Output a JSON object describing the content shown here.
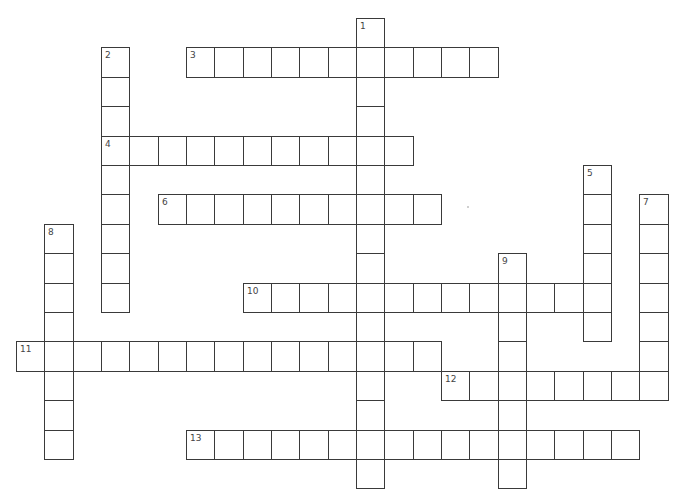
{
  "puzzle": {
    "grid": {
      "origin_x": 16,
      "origin_y": 18,
      "col_pitch": 28.33,
      "row_pitch": 29.4,
      "line_color": "#3a3a3a",
      "cell_fill": "#ffffff"
    },
    "words": [
      {
        "number": "1",
        "direction": "down",
        "row": 0,
        "col": 12,
        "length": 16
      },
      {
        "number": "2",
        "direction": "down",
        "row": 1,
        "col": 3,
        "length": 9
      },
      {
        "number": "3",
        "direction": "across",
        "row": 1,
        "col": 6,
        "length": 11
      },
      {
        "number": "4",
        "direction": "across",
        "row": 4,
        "col": 3,
        "length": 11
      },
      {
        "number": "5",
        "direction": "down",
        "row": 5,
        "col": 20,
        "length": 6
      },
      {
        "number": "6",
        "direction": "across",
        "row": 6,
        "col": 5,
        "length": 10
      },
      {
        "number": "7",
        "direction": "down",
        "row": 6,
        "col": 22,
        "length": 7
      },
      {
        "number": "8",
        "direction": "down",
        "row": 7,
        "col": 1,
        "length": 8
      },
      {
        "number": "9",
        "direction": "down",
        "row": 8,
        "col": 17,
        "length": 8
      },
      {
        "number": "10",
        "direction": "across",
        "row": 9,
        "col": 8,
        "length": 13
      },
      {
        "number": "11",
        "direction": "across",
        "row": 11,
        "col": 0,
        "length": 15
      },
      {
        "number": "12",
        "direction": "across",
        "row": 12,
        "col": 15,
        "length": 8
      },
      {
        "number": "13",
        "direction": "across",
        "row": 14,
        "col": 6,
        "length": 16
      }
    ],
    "speck": {
      "x": 467,
      "y": 206
    }
  }
}
